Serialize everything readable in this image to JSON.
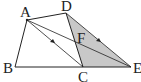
{
  "diagram": {
    "type": "geometry",
    "points": {
      "A": {
        "label": "A",
        "x": 27,
        "y": 20
      },
      "B": {
        "label": "B",
        "x": 15,
        "y": 67
      },
      "C": {
        "label": "C",
        "x": 83,
        "y": 67
      },
      "D": {
        "label": "D",
        "x": 66,
        "y": 13
      },
      "E": {
        "label": "E",
        "x": 131,
        "y": 67
      },
      "F": {
        "label": "F",
        "x": 76,
        "y": 39
      }
    },
    "segments": [
      "AB",
      "BC",
      "CE",
      "AD",
      "DC",
      "DE",
      "AE",
      "AC"
    ],
    "shaded_region": [
      "D",
      "C",
      "E"
    ],
    "shade_color": "#c8c8c8",
    "line_color": "#222222",
    "arrow_marks": [
      "AC",
      "DE"
    ]
  }
}
